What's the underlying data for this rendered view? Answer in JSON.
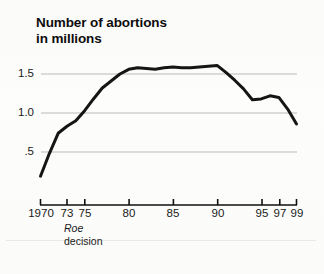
{
  "chart_data": {
    "type": "line",
    "title": "Number of abortions in millions",
    "title_lines": [
      "Number of abortions",
      "in millions"
    ],
    "xlabel": "",
    "ylabel": "",
    "ylim": [
      0,
      1.75
    ],
    "xlim": [
      1970,
      1999
    ],
    "grid": true,
    "gridlines_y": [
      0.5,
      1.0,
      1.5
    ],
    "legend": "none",
    "yticks": [
      0.5,
      1.0,
      1.5
    ],
    "ytick_labels": [
      ".5",
      "1.0",
      "1.5"
    ],
    "xticks": [
      1970,
      1973,
      1975,
      1980,
      1985,
      1990,
      1995,
      1997,
      1999
    ],
    "xtick_labels": [
      "1970",
      "73",
      "75",
      "80",
      "85",
      "90",
      "95",
      "97",
      "99"
    ],
    "annotations": [
      {
        "text": "Roe decision",
        "lines": [
          "Roe",
          "decision"
        ],
        "x": 1973,
        "style": "first-line-italic"
      }
    ],
    "series": [
      {
        "name": "Number of abortions (millions)",
        "color": "#151515",
        "line_width": 3,
        "x": [
          1970,
          1971,
          1972,
          1973,
          1974,
          1975,
          1976,
          1977,
          1978,
          1979,
          1980,
          1981,
          1982,
          1983,
          1984,
          1985,
          1986,
          1987,
          1988,
          1989,
          1990,
          1991,
          1992,
          1993,
          1994,
          1995,
          1996,
          1997,
          1998,
          1999
        ],
        "values": [
          0.19,
          0.48,
          0.74,
          0.83,
          0.9,
          1.03,
          1.18,
          1.32,
          1.41,
          1.5,
          1.56,
          1.58,
          1.57,
          1.56,
          1.58,
          1.59,
          1.58,
          1.58,
          1.59,
          1.6,
          1.61,
          1.52,
          1.42,
          1.31,
          1.17,
          1.18,
          1.22,
          1.2,
          1.05,
          0.86
        ]
      }
    ]
  },
  "axis": {
    "y_label_values": [
      ".5",
      "1.0",
      "1.5"
    ],
    "x_label_values": [
      "1970",
      "73",
      "75",
      "80",
      "85",
      "90",
      "95",
      "97",
      "99"
    ]
  },
  "colors": {
    "line": "#151515",
    "grid": "#b9b9b6",
    "axis": "#111111",
    "text": "#1a1a1a",
    "background": "#fdfdfc"
  }
}
